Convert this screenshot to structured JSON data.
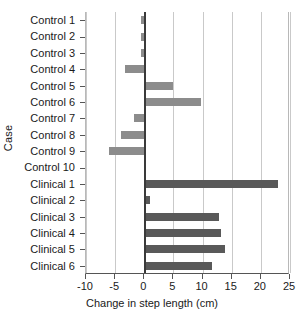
{
  "chart_data": {
    "type": "bar",
    "orientation": "horizontal",
    "title": "",
    "xlabel": "Change in step length (cm)",
    "ylabel": "Case",
    "xlim": [
      -10,
      25
    ],
    "ylim": null,
    "grid": true,
    "legend": null,
    "xticks": [
      -10,
      -5,
      0,
      5,
      10,
      15,
      20,
      25
    ],
    "xticklabels": [
      "-10",
      "-5",
      "0",
      "5",
      "10",
      "15",
      "20",
      "25"
    ],
    "zero_line": 0,
    "categories": [
      "Control 1",
      "Control 2",
      "Control 3",
      "Control 4",
      "Control 5",
      "Control 6",
      "Control 7",
      "Control 8",
      "Control 9",
      "Control 10",
      "Clinical 1",
      "Clinical 2",
      "Clinical 3",
      "Clinical 4",
      "Clinical 5",
      "Clinical 6"
    ],
    "values": [
      -0.6,
      -0.6,
      -0.6,
      -3.3,
      5.0,
      9.8,
      -1.7,
      -4.0,
      -6.0,
      0.0,
      23.0,
      1.0,
      12.9,
      13.1,
      13.8,
      11.6
    ],
    "groups": [
      "control",
      "control",
      "control",
      "control",
      "control",
      "control",
      "control",
      "control",
      "control",
      "control",
      "clinical",
      "clinical",
      "clinical",
      "clinical",
      "clinical",
      "clinical"
    ],
    "colors": {
      "control": "#8c8c8c",
      "clinical": "#595959",
      "grid": "#c9c9c9",
      "zero_line": "#3a3a3a",
      "axis": "#555555",
      "text": "#1a1a1a",
      "background": "#ffffff"
    }
  }
}
